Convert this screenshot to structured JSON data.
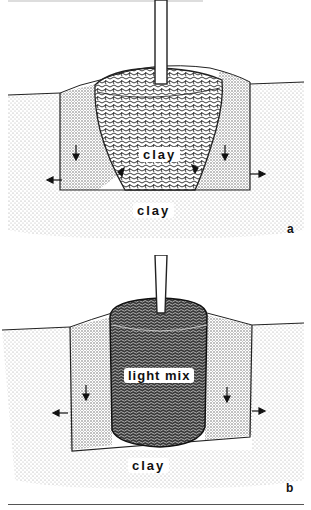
{
  "figure": {
    "top_text_fragment": "",
    "panels": [
      {
        "id": "a",
        "letter": "a",
        "labels": {
          "inner": "clay",
          "outer": "clay"
        },
        "description": "Tree root ball of clay in a planting hole; arrows show water movement"
      },
      {
        "id": "b",
        "letter": "b",
        "labels": {
          "inner": "light mix",
          "outer": "clay"
        },
        "description": "Root ball of light mix in a planting hole in clay soil; arrows show water movement"
      }
    ]
  },
  "colors": {
    "ink": "#111111",
    "soil_stipple": "#bdbdbd",
    "fill_stipple": "#8c8c8c",
    "background": "#ffffff"
  }
}
